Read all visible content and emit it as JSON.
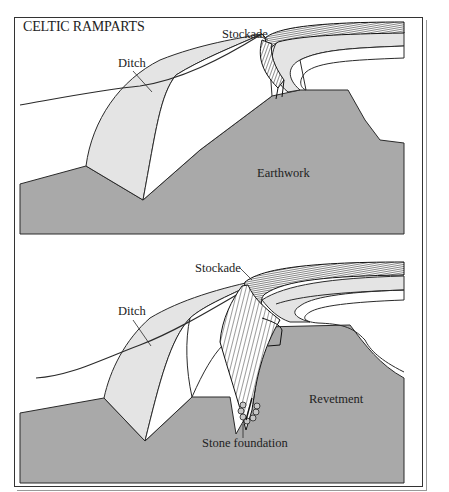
{
  "title": "CELTIC RAMPARTS",
  "colors": {
    "earth": "#a9a9a9",
    "ditch_fill": "#e4e4e4",
    "line": "#2a2a2a",
    "background": "#ffffff"
  },
  "panels": [
    {
      "id": "top",
      "labels": {
        "ditch": "Ditch",
        "stockade": "Stockade",
        "earthwork": "Earthwork"
      }
    },
    {
      "id": "bottom",
      "labels": {
        "ditch": "Ditch",
        "stockade": "Stockade",
        "revetment": "Revetment",
        "stone_foundation": "Stone foundation"
      }
    }
  ]
}
